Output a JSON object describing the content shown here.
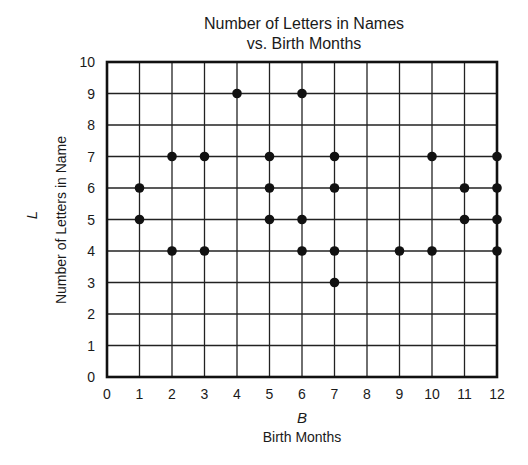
{
  "chart_data": {
    "type": "scatter",
    "title": "Number of Letters in Names vs. Birth Months",
    "title_lines": [
      "Number of Letters in Names",
      "vs. Birth Months"
    ],
    "xlabel_var": "B",
    "xlabel": "Birth Months",
    "ylabel_var": "L",
    "ylabel": "Number of Letters in Name",
    "xlim": [
      0,
      12
    ],
    "ylim": [
      0,
      10
    ],
    "x_ticks": [
      0,
      1,
      2,
      3,
      4,
      5,
      6,
      7,
      8,
      9,
      10,
      11,
      12
    ],
    "y_ticks": [
      0,
      1,
      2,
      3,
      4,
      5,
      6,
      7,
      8,
      9,
      10
    ],
    "grid": true,
    "legend": null,
    "points": [
      {
        "x": 1,
        "y": 5
      },
      {
        "x": 1,
        "y": 6
      },
      {
        "x": 2,
        "y": 4
      },
      {
        "x": 2,
        "y": 7
      },
      {
        "x": 3,
        "y": 4
      },
      {
        "x": 3,
        "y": 7
      },
      {
        "x": 4,
        "y": 9
      },
      {
        "x": 5,
        "y": 5
      },
      {
        "x": 5,
        "y": 6
      },
      {
        "x": 5,
        "y": 7
      },
      {
        "x": 6,
        "y": 4
      },
      {
        "x": 6,
        "y": 5
      },
      {
        "x": 6,
        "y": 9
      },
      {
        "x": 7,
        "y": 3
      },
      {
        "x": 7,
        "y": 4
      },
      {
        "x": 7,
        "y": 6
      },
      {
        "x": 7,
        "y": 7
      },
      {
        "x": 9,
        "y": 4
      },
      {
        "x": 10,
        "y": 4
      },
      {
        "x": 10,
        "y": 7
      },
      {
        "x": 11,
        "y": 5
      },
      {
        "x": 11,
        "y": 6
      },
      {
        "x": 12,
        "y": 4
      },
      {
        "x": 12,
        "y": 5
      },
      {
        "x": 12,
        "y": 6
      },
      {
        "x": 12,
        "y": 7
      }
    ],
    "colors": {
      "point": "#111111",
      "grid": "#222222",
      "frame": "#111111"
    }
  }
}
